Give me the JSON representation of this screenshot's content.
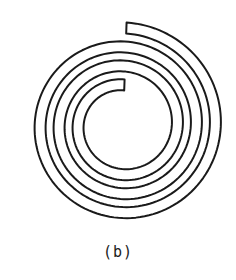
{
  "figure": {
    "caption": "(b)",
    "stroke_color": "#1a1a1a",
    "background": "#ffffff",
    "spiral": {
      "center": [
        123,
        125
      ],
      "inner_mid_radius": 40,
      "pitch_per_turn": 19,
      "band_width": 11,
      "turns": 3,
      "start_angle_deg": -88,
      "stroke_width": 2
    }
  }
}
